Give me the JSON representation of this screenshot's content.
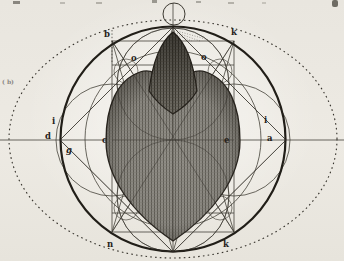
{
  "figure": {
    "type": "geometric-construction-engraving",
    "colors": {
      "paper": "#ebe8e1",
      "ink": "#413e36",
      "bold_ink": "#1f1c16",
      "shade_mid": "#8e8b84",
      "shade_dark": "#5a574f",
      "dotted": "#35322b"
    }
  },
  "point_labels": [
    {
      "text": "b",
      "x": 104,
      "y": 37
    },
    {
      "text": "k",
      "x": 231,
      "y": 35
    },
    {
      "text": "o",
      "x": 131,
      "y": 61
    },
    {
      "text": "o",
      "x": 201,
      "y": 60
    },
    {
      "text": "i",
      "x": 52,
      "y": 124
    },
    {
      "text": "d",
      "x": 45,
      "y": 139
    },
    {
      "text": "g",
      "x": 66,
      "y": 153,
      "italic": true
    },
    {
      "text": "c",
      "x": 102,
      "y": 143
    },
    {
      "text": "e",
      "x": 224,
      "y": 143
    },
    {
      "text": "i",
      "x": 264,
      "y": 123
    },
    {
      "text": "a",
      "x": 267,
      "y": 141
    },
    {
      "text": "n",
      "x": 107,
      "y": 247
    },
    {
      "text": "k",
      "x": 223,
      "y": 247
    },
    {
      "text": "( b)",
      "x": 2,
      "y": 84,
      "size": 6,
      "opacity": 0.5
    }
  ]
}
